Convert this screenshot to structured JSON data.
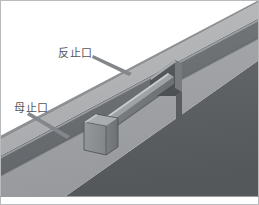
{
  "figure": {
    "type": "technical-isometric-diagram",
    "background_color": "#ffffff",
    "frame": {
      "visible": true,
      "color": "#b9bbbd",
      "bottom_rule_color": "#9a9c9e"
    },
    "palette": {
      "panel_top_light": "#b3b5b7",
      "panel_top_light_2": "#aaacae",
      "stripe_dark": "#6e7073",
      "stripe_dark_2": "#646669",
      "band_mid": "#9b9da0",
      "front_face_dark": "#5e6063",
      "front_face_dark_2": "#565a5d",
      "tongue_face": "#8d9093",
      "tongue_side": "#73767a",
      "tongue_top": "#a8abad",
      "groove_shadow": "#4f5255",
      "highlight_edge": "#c8cacc",
      "leader_line": "#7a7c7f",
      "label_text": "#55565a"
    },
    "labels": [
      {
        "id": "label-fan-zhi-kou",
        "text": "反止口",
        "meaning": "counter / reverse stop-port",
        "x": 58,
        "y": 53,
        "leader_from": [
          94,
          56
        ],
        "leader_to": [
          131,
          73
        ]
      },
      {
        "id": "label-mu-zhi-kou",
        "text": "母止口",
        "meaning": "female / mother stop-port",
        "x": 14,
        "y": 108,
        "leader_from": [
          30,
          113
        ],
        "leader_to": [
          68,
          136
        ]
      }
    ],
    "geometry_notes": {
      "view": "isometric, panels running lower-left to upper-right",
      "bands": [
        "upper light panel face",
        "dark recessed stripe (groove)",
        "mid light band",
        "dark front edge face"
      ],
      "features": [
        "protruding rectangular tongue block at center",
        "stepped notch cut at upper-right of the groove"
      ]
    }
  }
}
